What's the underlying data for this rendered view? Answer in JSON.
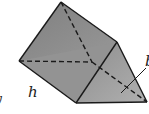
{
  "diagram": {
    "type": "triangular-prism",
    "labels": {
      "h": "h",
      "b_partial": "b",
      "left_partial": "y"
    },
    "colors": {
      "face_left": "#8c8c8c",
      "face_front": "#9a9a9a",
      "face_right": "#a6a6a6",
      "edge": "#1a1a1a",
      "background": "#ffffff"
    }
  }
}
